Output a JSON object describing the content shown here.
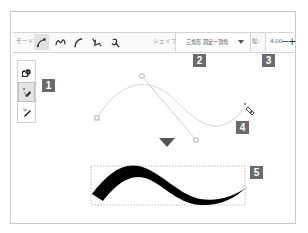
{
  "toolbar": {
    "mode_label": "モード:",
    "modes": [
      {
        "name": "line-mode",
        "icon": "pen-node-icon",
        "active": true
      },
      {
        "name": "smooth-mode",
        "icon": "spiral-curve-icon",
        "active": false
      },
      {
        "name": "curve-mode",
        "icon": "curve-icon",
        "active": false
      },
      {
        "name": "sketch-mode",
        "icon": "sketch-icon",
        "active": false
      },
      {
        "name": "calligraphy-mode",
        "icon": "calligraphy-icon",
        "active": false
      }
    ],
    "shape_label": "シェイプ:",
    "shape_value": "三角形 固定ー頂角",
    "width_label": "幅:",
    "width_value": "4.00",
    "decrement": "−",
    "increment": "+"
  },
  "side_tools": [
    {
      "name": "spiral-tool",
      "icon": "spiral-icon",
      "active": false
    },
    {
      "name": "pen-tool",
      "icon": "pen-icon",
      "active": true
    },
    {
      "name": "pencil-tool",
      "icon": "pencil-icon",
      "active": false
    }
  ],
  "badges": {
    "b1": "1",
    "b2": "2",
    "b3": "3",
    "b4": "4",
    "b5": "5"
  },
  "colors": {
    "badge": "#6b6b6b",
    "guide_curve": "#d0d0d0",
    "stroke": "#000000"
  }
}
